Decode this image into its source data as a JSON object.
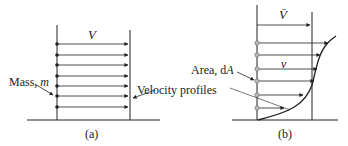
{
  "panel_a": {
    "caption": "(a)",
    "velocity_label": "V",
    "mass_label_prefix": "Mass, ",
    "mass_symbol": "m",
    "arrow_rows_y": [
      44,
      55,
      65,
      76,
      86,
      96,
      107
    ],
    "left_wall_x": 57,
    "right_wall_x": 130,
    "arrow_end_x": 128,
    "ground_y": 120
  },
  "panel_b": {
    "caption": "(b)",
    "mean_velocity_label": "V̄",
    "local_velocity_label": "v",
    "area_label_prefix": "Area, d",
    "area_symbol": "A",
    "velocity_profiles_label": "Velocity profiles",
    "left_wall_x": 257,
    "right_wall_x": 312,
    "ground_y": 120,
    "mean_arrow": {
      "y": 25,
      "x_end": 310
    },
    "profile_arrows": [
      {
        "y": 43,
        "x_end": 328
      },
      {
        "y": 55,
        "x_end": 320
      },
      {
        "y": 69,
        "x_end": 317
      },
      {
        "y": 81,
        "x_end": 314
      },
      {
        "y": 95,
        "x_end": 303
      },
      {
        "y": 108,
        "x_end": 284
      }
    ]
  },
  "colors": {
    "line": "#222222",
    "circle_fill": "#bbbbbb"
  }
}
